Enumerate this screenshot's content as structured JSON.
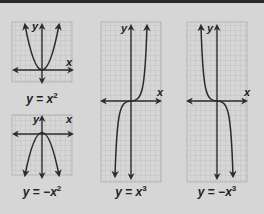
{
  "colors": {
    "background": "#d6d6d6",
    "grid_minor": "#b4b4b4",
    "grid_major": "#a0a0a0",
    "curve": "#2b2b2b",
    "axes": "#2b2b2b",
    "top_strip": "#2a2a2a"
  },
  "graphs": [
    {
      "id": "parabola-up",
      "axis_x_label": "x",
      "axis_y_label": "y",
      "caption": {
        "lhs": "y",
        "eq": " = ",
        "rhs": "x",
        "exp": "2"
      },
      "function": "x^2"
    },
    {
      "id": "parabola-down",
      "axis_x_label": "x",
      "axis_y_label": "y",
      "caption": {
        "lhs": "y",
        "eq": " = ",
        "rhs": "−x",
        "exp": "2"
      },
      "function": "-x^2"
    },
    {
      "id": "cubic-up",
      "axis_x_label": "x",
      "axis_y_label": "y",
      "caption": {
        "lhs": "y",
        "eq": " = ",
        "rhs": "x",
        "exp": "3"
      },
      "function": "x^3"
    },
    {
      "id": "cubic-down",
      "axis_x_label": "x",
      "axis_y_label": "y",
      "caption": {
        "lhs": "y",
        "eq": " = ",
        "rhs": "−x",
        "exp": "3"
      },
      "function": "-x^3"
    }
  ]
}
